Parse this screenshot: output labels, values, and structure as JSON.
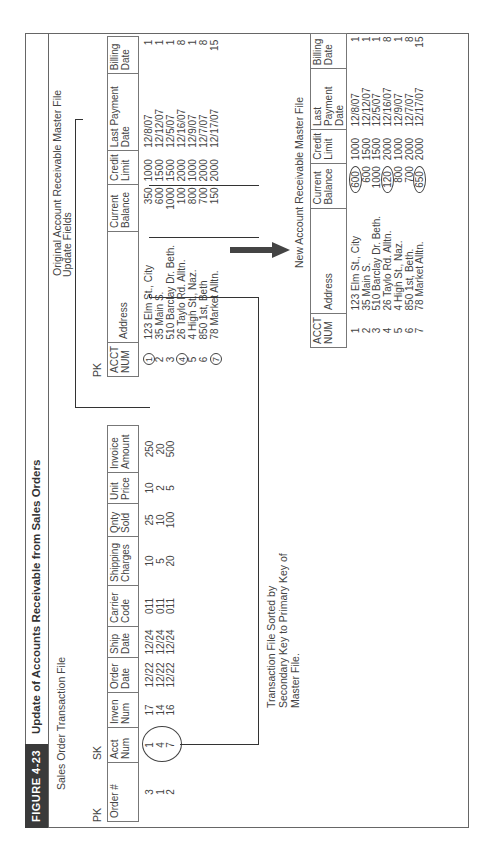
{
  "figure": {
    "label": "FIGURE 4-23",
    "title": "Update of Accounts Receivable from Sales Orders"
  },
  "sales_order_file": {
    "title": "Sales Order Transaction File",
    "pk_label": "PK",
    "sk_label": "SK",
    "columns": [
      "Order #",
      "Acct Num",
      "Inven Num",
      "Order Date",
      "Ship Date",
      "Carrier Code",
      "Shipping Charges",
      "Qnty Sold",
      "Unit Price",
      "Invoice Amount"
    ],
    "rows": [
      [
        "3",
        "1",
        "17",
        "12/22",
        "12/24",
        "011",
        "10",
        "25",
        "10",
        "250"
      ],
      [
        "1",
        "4",
        "14",
        "12/22",
        "12/24",
        "011",
        "5",
        "10",
        "2",
        "20"
      ],
      [
        "2",
        "7",
        "16",
        "12/22",
        "12/24",
        "011",
        "20",
        "100",
        "5",
        "500"
      ]
    ]
  },
  "original_master_file": {
    "title": "Original Account Receivable Master File",
    "update_fields_label": "Update Fields",
    "pk_label": "PK",
    "columns": [
      "ACCT NUM",
      "Address",
      "Current Balance",
      "Credit Limit",
      "Last Payment Date",
      "Billing Date"
    ],
    "rows": [
      [
        "1",
        "123 Elm St., City",
        "350",
        "1000",
        "12/8/07",
        "1"
      ],
      [
        "2",
        "35 Main S.",
        "600",
        "1500",
        "12/12/07",
        "1"
      ],
      [
        "3",
        "510 Barclay Dr. Beth.",
        "1000",
        "1500",
        "12/5/07",
        "1"
      ],
      [
        "4",
        "26 Taylo Rd. Alltn.",
        "100",
        "2000",
        "12/16/07",
        "8"
      ],
      [
        "5",
        "4 High St., Naz.",
        "800",
        "1000",
        "12/9/07",
        "1"
      ],
      [
        "6",
        "850 1st, Beth",
        "700",
        "2000",
        "12/7/07",
        "8"
      ],
      [
        "7",
        "78 Market Alltn.",
        "150",
        "2000",
        "12/17/07",
        "15"
      ]
    ],
    "circled_keys": [
      "1",
      "4",
      "7"
    ]
  },
  "new_master_file": {
    "title": "New Account Receivable Master File",
    "columns": [
      "ACCT NUM",
      "Address",
      "Current Balance",
      "Credit Limit",
      "Last Payment Date",
      "Billing Date"
    ],
    "rows": [
      [
        "1",
        "123 Elm St., City",
        "600",
        "1000",
        "12/8/07",
        "1"
      ],
      [
        "2",
        "35 Main S.",
        "600",
        "1500",
        "12/12/07",
        "1"
      ],
      [
        "3",
        "510 Barclay Dr. Beth.",
        "1000",
        "1500",
        "12/5/07",
        "1"
      ],
      [
        "4",
        "26 Taylo Rd. Alltn.",
        "120",
        "2000",
        "12/16/07",
        "8"
      ],
      [
        "5",
        "4 High St., Naz.",
        "800",
        "1000",
        "12/9/07",
        "1"
      ],
      [
        "6",
        "850 1st, Beth.",
        "700",
        "2000",
        "12/7/07",
        "8"
      ],
      [
        "7",
        "78 Market Alltn.",
        "650",
        "2000",
        "12/17/07",
        "15"
      ]
    ],
    "circled_balances": [
      "600",
      "120",
      "650"
    ]
  },
  "annotation": {
    "line1": "Transaction File Sorted by",
    "line2": "Secondary Key to Primary Key of",
    "line3": "Master File."
  },
  "icons": {
    "arrow": "right-arrow-icon"
  }
}
